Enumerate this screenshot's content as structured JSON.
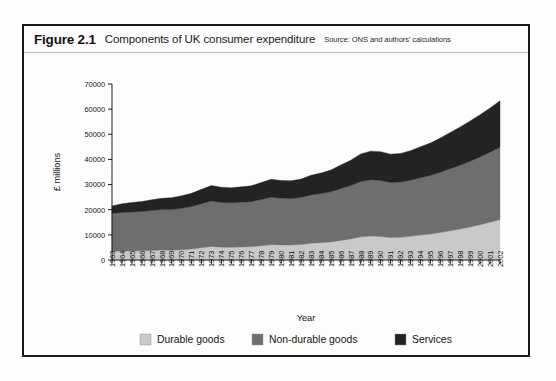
{
  "figure": {
    "number": "Figure 2.1",
    "title": "Components of UK consumer expenditure",
    "source": "Source: ONS and authors' calculations"
  },
  "legend": {
    "items": [
      {
        "label": "Durable goods",
        "color": "#c9c9c9"
      },
      {
        "label": "Non-durable goods",
        "color": "#6e6e6e"
      },
      {
        "label": "Services",
        "color": "#232323"
      }
    ]
  },
  "axes": {
    "y_label": "£ millions",
    "x_label": "Year",
    "y_ticks": [
      "0",
      "10000",
      "20000",
      "30000",
      "40000",
      "50000",
      "60000",
      "70000"
    ],
    "x_ticks": [
      "1963",
      "1964",
      "1965",
      "1966",
      "1967",
      "1968",
      "1969",
      "1970",
      "1971",
      "1972",
      "1973",
      "1974",
      "1975",
      "1976",
      "1977",
      "1978",
      "1979",
      "1980",
      "1981",
      "1982",
      "1983",
      "1984",
      "1985",
      "1986",
      "1987",
      "1988",
      "1989",
      "1990",
      "1991",
      "1992",
      "1993",
      "1994",
      "1995",
      "1996",
      "1997",
      "1998",
      "1999",
      "2000",
      "2001",
      "2002"
    ]
  },
  "chart_data": {
    "type": "area",
    "stacked": true,
    "title": "Components of UK consumer expenditure",
    "xlabel": "Year",
    "ylabel": "£ millions",
    "xlim": [
      1963,
      2002
    ],
    "ylim": [
      0,
      70000
    ],
    "grid": false,
    "legend_position": "bottom",
    "categories": [
      1963,
      1964,
      1965,
      1966,
      1967,
      1968,
      1969,
      1970,
      1971,
      1972,
      1973,
      1974,
      1975,
      1976,
      1977,
      1978,
      1979,
      1980,
      1981,
      1982,
      1983,
      1984,
      1985,
      1986,
      1987,
      1988,
      1989,
      1990,
      1991,
      1992,
      1993,
      1994,
      1995,
      1996,
      1997,
      1998,
      1999,
      2000,
      2001,
      2002
    ],
    "series": [
      {
        "name": "Durable goods",
        "color": "#c9c9c9",
        "values": [
          3400,
          3550,
          3600,
          3650,
          3800,
          3950,
          3900,
          4050,
          4350,
          4900,
          5400,
          5100,
          5050,
          5200,
          5300,
          5700,
          6100,
          6000,
          5950,
          6200,
          6700,
          6900,
          7200,
          7800,
          8400,
          9200,
          9500,
          9300,
          8900,
          9000,
          9400,
          9900,
          10300,
          10900,
          11600,
          12300,
          13100,
          14000,
          15000,
          16100
        ],
        "endpoint_values": {
          "1963": 3400,
          "2002": 16100
        }
      },
      {
        "name": "Non-durable goods",
        "color": "#6e6e6e",
        "values": [
          15100,
          15300,
          15450,
          15600,
          15900,
          16100,
          16150,
          16500,
          16900,
          17500,
          18100,
          17800,
          17700,
          17800,
          17900,
          18400,
          18900,
          18600,
          18500,
          18700,
          19200,
          19500,
          19900,
          20600,
          21200,
          22000,
          22400,
          22300,
          21900,
          22000,
          22300,
          22800,
          23300,
          24000,
          24700,
          25400,
          26200,
          27000,
          27900,
          28700
        ],
        "endpoint_values": {
          "1963": 15100,
          "2002": 28700
        },
        "cumulative_top": {
          "1963": 18500,
          "2002": 44800
        }
      },
      {
        "name": "Services",
        "color": "#232323",
        "values": [
          3000,
          3500,
          3850,
          4050,
          4250,
          4500,
          4750,
          5000,
          5300,
          5700,
          6100,
          6000,
          5950,
          6100,
          6300,
          6700,
          7100,
          7000,
          7050,
          7300,
          7800,
          8200,
          8700,
          9400,
          10100,
          11000,
          11400,
          11500,
          11300,
          11400,
          11800,
          12300,
          12900,
          13600,
          14400,
          15200,
          16000,
          16800,
          17600,
          18500
        ],
        "endpoint_values": {
          "1963": 3000,
          "2002": 18500
        },
        "cumulative_top": {
          "1963": 21500,
          "2002": 63300
        }
      }
    ],
    "totals": [
      21500,
      22350,
      22900,
      23300,
      23950,
      24550,
      24800,
      25550,
      26550,
      28100,
      29600,
      28900,
      28700,
      29100,
      29500,
      30800,
      32100,
      31600,
      31500,
      32200,
      33700,
      34600,
      35800,
      37800,
      39700,
      42200,
      43300,
      43100,
      42100,
      42400,
      43500,
      45000,
      46500,
      48500,
      50700,
      52900,
      55300,
      57800,
      60500,
      63300
    ]
  }
}
